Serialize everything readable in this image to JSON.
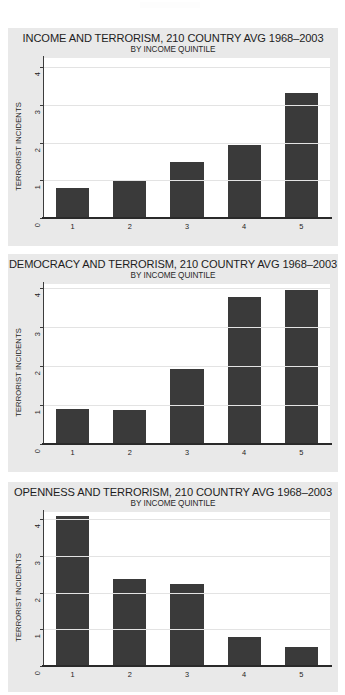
{
  "page": {
    "background_color": "#ffffff",
    "panel_background_color": "#e9e9e9",
    "plot_background_color": "#ffffff",
    "bar_color": "#3a3a3a",
    "gridline_color": "#e3e3e3",
    "axis_color": "#2a2a2a"
  },
  "chart_data": [
    {
      "type": "bar",
      "title": "INCOME AND TERRORISM, 210 COUNTRY AVG 1968–2003",
      "subtitle": "BY INCOME QUINTILE",
      "xlabel": "",
      "ylabel": "TERRORIST INCIDENTS",
      "categories": [
        "1",
        "2",
        "3",
        "4",
        "5"
      ],
      "values": [
        0.8,
        0.97,
        1.5,
        1.93,
        3.33
      ],
      "yticks": [
        "0",
        "1",
        "2",
        "3",
        "4"
      ],
      "ylim": [
        0,
        4.25
      ],
      "grid": true,
      "legend": "none"
    },
    {
      "type": "bar",
      "title": "DEMOCRACY AND TERRORISM, 210 COUNTRY AVG 1968–2003",
      "subtitle": "BY INCOME QUINTILE",
      "xlabel": "",
      "ylabel": "TERRORIST INCIDENTS",
      "categories": [
        "1",
        "2",
        "3",
        "4",
        "5"
      ],
      "values": [
        0.9,
        0.88,
        1.92,
        3.78,
        3.95
      ],
      "yticks": [
        "0",
        "1",
        "2",
        "3",
        "4"
      ],
      "ylim": [
        0,
        4.1
      ],
      "grid": true,
      "legend": "none"
    },
    {
      "type": "bar",
      "title": "OPENNESS AND TERRORISM, 210 COUNTRY AVG 1968–2003",
      "subtitle": "BY INCOME QUINTILE",
      "xlabel": "",
      "ylabel": "TERRORIST INCIDENTS",
      "categories": [
        "1",
        "2",
        "3",
        "4",
        "5"
      ],
      "values": [
        4.08,
        2.37,
        2.25,
        0.8,
        0.52
      ],
      "yticks": [
        "0",
        "1",
        "2",
        "3",
        "4"
      ],
      "ylim": [
        0,
        4.2
      ],
      "grid": true,
      "legend": "none"
    }
  ]
}
